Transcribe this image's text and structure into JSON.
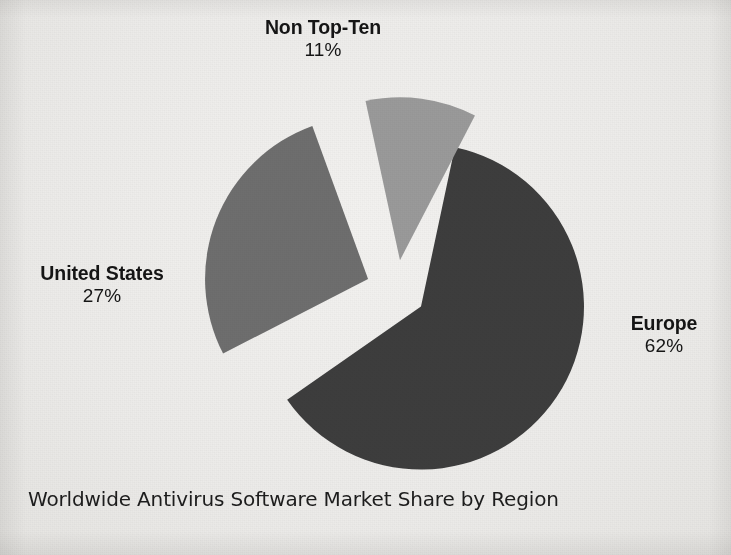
{
  "caption": "Worldwide Antivirus Software Market Share by Region",
  "colors": {
    "background": "#efeeec",
    "text": "#151515",
    "europe": "#3d3d3d",
    "united_states": "#6e6e6e",
    "non_top_ten": "#9a9a9a"
  },
  "labels": {
    "non_top_ten": {
      "name": "Non Top-Ten",
      "percent": "11%"
    },
    "united_states": {
      "name": "United States",
      "percent": "27%"
    },
    "europe": {
      "name": "Europe",
      "percent": "62%"
    }
  },
  "chart_data": {
    "type": "pie",
    "title": "Worldwide Antivirus Software Market Share by Region",
    "xlabel": "",
    "ylabel": "",
    "units": "percent",
    "total": 100,
    "exploded": true,
    "legend": "none",
    "grid": false,
    "labels_shown": "category name and percentage outside each slice",
    "categories": [
      "Europe",
      "United States",
      "Non Top-Ten"
    ],
    "values": [
      62,
      27,
      11
    ],
    "slices": [
      {
        "name": "Europe",
        "value": 62,
        "label": "Europe",
        "percent_label": "62%",
        "color": "#3d3d3d",
        "start_angle_deg": -78,
        "end_angle_deg": 145.2,
        "sweep_deg": 223.2,
        "exploded": true
      },
      {
        "name": "United States",
        "value": 27,
        "label": "United States",
        "percent_label": "27%",
        "color": "#6e6e6e",
        "start_angle_deg": 152.8,
        "end_angle_deg": 250.0,
        "sweep_deg": 97.2,
        "exploded": true
      },
      {
        "name": "Non Top-Ten",
        "value": 11,
        "label": "Non Top-Ten",
        "percent_label": "11%",
        "color": "#9a9a9a",
        "start_angle_deg": 257.8,
        "end_angle_deg": 297.4,
        "sweep_deg": 39.6,
        "exploded": true
      }
    ]
  }
}
